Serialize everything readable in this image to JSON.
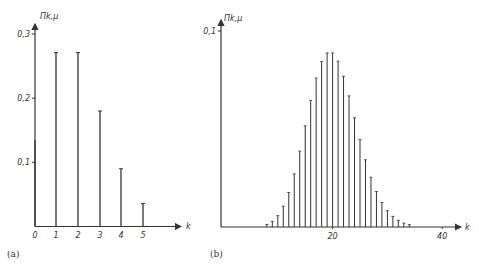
{
  "chart_data": [
    {
      "type": "bar",
      "panel": "(a)",
      "title": "",
      "xlabel": "k",
      "ylabel": "Π_{k,μ}",
      "mu": 2,
      "categories": [
        "0",
        "1",
        "2",
        "3",
        "4",
        "5"
      ],
      "values": [
        0.135,
        0.271,
        0.271,
        0.18,
        0.09,
        0.036
      ],
      "yticks": [
        "0,1",
        "0,2",
        "0,3"
      ],
      "ytick_values": [
        0.1,
        0.2,
        0.3
      ],
      "xticks": [
        "0",
        "1",
        "2",
        "3",
        "4",
        "5"
      ],
      "ylim": [
        0,
        0.3
      ],
      "grid": false
    },
    {
      "type": "bar",
      "panel": "(b)",
      "title": "",
      "xlabel": "k",
      "ylabel": "Π_{k,μ}",
      "mu": 20,
      "categories": [
        "8",
        "9",
        "10",
        "11",
        "12",
        "13",
        "14",
        "15",
        "16",
        "17",
        "18",
        "19",
        "20",
        "21",
        "22",
        "23",
        "24",
        "25",
        "26",
        "27",
        "28",
        "29",
        "30",
        "31",
        "32",
        "33",
        "34"
      ],
      "values": [
        0.0013,
        0.0029,
        0.0058,
        0.0106,
        0.0176,
        0.0271,
        0.0387,
        0.0516,
        0.0646,
        0.076,
        0.0844,
        0.0888,
        0.0888,
        0.0846,
        0.0769,
        0.0669,
        0.0557,
        0.0446,
        0.0343,
        0.0254,
        0.0181,
        0.0125,
        0.0083,
        0.0054,
        0.0034,
        0.002,
        0.0012
      ],
      "yticks": [
        "0,1"
      ],
      "ytick_values": [
        0.1
      ],
      "xticks": [
        "20",
        "40"
      ],
      "ylim": [
        0,
        0.1
      ],
      "grid": false
    }
  ],
  "panels": {
    "a": {
      "caption": "(a)",
      "ylabel": "Πk,μ",
      "xlabel": "k",
      "yticks": [
        "0,1",
        "0,2",
        "0,3"
      ],
      "xticks": [
        "0",
        "1",
        "2",
        "3",
        "4",
        "5"
      ]
    },
    "b": {
      "caption": "(b)",
      "ylabel": "Πk,μ",
      "xlabel": "k",
      "yticks": [
        "0,1"
      ],
      "xticks": [
        "20",
        "40"
      ]
    }
  }
}
